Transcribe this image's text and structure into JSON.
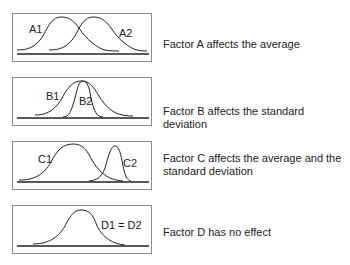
{
  "panels": [
    {
      "id": "A",
      "curve_labels": [
        "A1",
        "A2"
      ],
      "description": "Factor A affects the average"
    },
    {
      "id": "B",
      "curve_labels": [
        "B1",
        "B2"
      ],
      "description": "Factor B affects the standard deviation"
    },
    {
      "id": "C",
      "curve_labels": [
        "C1",
        "C2"
      ],
      "description_line1": "Factor C affects the average and the",
      "description_line2": "standard deviation"
    },
    {
      "id": "D",
      "curve_labels": [
        "D1 = D2"
      ],
      "description": "Factor D has no effect"
    }
  ],
  "colors": {
    "line": "#222222",
    "border": "#8a8a8a",
    "text": "#222222"
  }
}
